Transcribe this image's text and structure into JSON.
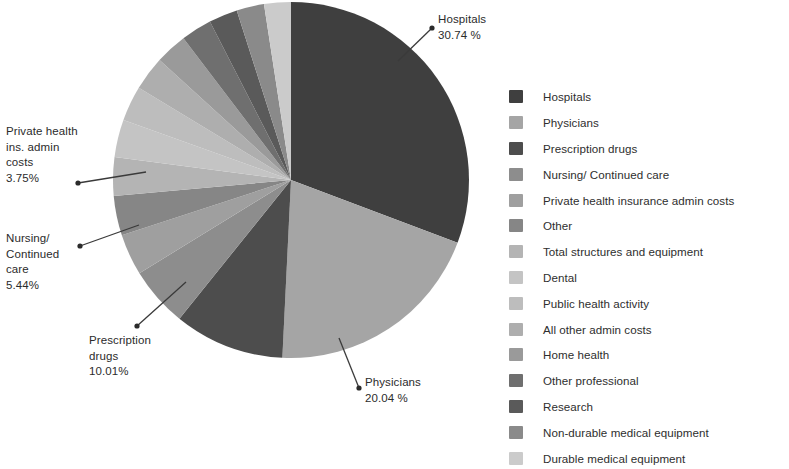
{
  "chart_data": {
    "type": "pie",
    "title": "",
    "start_angle_deg": 0,
    "direction": "clockwise",
    "center": {
      "x": 291,
      "y": 180
    },
    "radius": 178,
    "legend_position": "right",
    "categories": [
      "Hospitals",
      "Physicians",
      "Prescription drugs",
      "Nursing/ Continued care",
      "Private health insurance admin costs",
      "Other",
      "Total structures and equipment",
      "Dental",
      "Public health activity",
      "All other admin costs",
      "Home health",
      "Other professional",
      "Research",
      "Non-durable medical equipment",
      "Durable medical equipment"
    ],
    "values": [
      30.74,
      20.04,
      10.01,
      5.44,
      3.75,
      3.6,
      3.5,
      3.4,
      3.2,
      3.1,
      2.9,
      2.8,
      2.6,
      2.5,
      2.43
    ],
    "units": "%",
    "colors": [
      "#3f3f3f",
      "#a5a5a5",
      "#4d4d4d",
      "#8d8d8d",
      "#9f9f9f",
      "#868686",
      "#b4b4b4",
      "#c4c4c4",
      "#bdbdbd",
      "#aeaeae",
      "#9a9a9a",
      "#6f6f6f",
      "#5a5a5a",
      "#8a8a8a",
      "#cbcbcb"
    ],
    "labeled_slices": [
      {
        "name": "Hospitals",
        "value": 30.74,
        "label": "Hospitals\n30.74 %"
      },
      {
        "name": "Physicians",
        "value": 20.04,
        "label": "Physicians\n20.04 %"
      },
      {
        "name": "Prescription drugs",
        "value": 10.01,
        "label": "Prescription\ndrugs\n10.01%"
      },
      {
        "name": "Nursing/ Continued care",
        "value": 5.44,
        "label": "Nursing/\nContinued\ncare\n5.44%"
      },
      {
        "name": "Private health ins. admin costs",
        "value": 3.75,
        "label": "Private health\nins. admin\ncosts\n3.75%"
      }
    ]
  },
  "callouts": {
    "hospitals": "Hospitals\n30.74 %",
    "physicians": "Physicians\n20.04 %",
    "prescription_drugs": "Prescription\ndrugs\n10.01%",
    "nursing": "Nursing/\nContinued\ncare\n5.44%",
    "private_admin": "Private health\nins. admin\ncosts\n3.75%"
  },
  "legend": {
    "items": [
      {
        "label": "Hospitals",
        "color": "#3f3f3f"
      },
      {
        "label": "Physicians",
        "color": "#a5a5a5"
      },
      {
        "label": "Prescription drugs",
        "color": "#4d4d4d"
      },
      {
        "label": "Nursing/ Continued care",
        "color": "#8d8d8d"
      },
      {
        "label": "Private health insurance admin costs",
        "color": "#9f9f9f"
      },
      {
        "label": "Other",
        "color": "#868686"
      },
      {
        "label": "Total structures and equipment",
        "color": "#b4b4b4"
      },
      {
        "label": "Dental",
        "color": "#c4c4c4"
      },
      {
        "label": "Public health activity",
        "color": "#bdbdbd"
      },
      {
        "label": "All other admin costs",
        "color": "#aeaeae"
      },
      {
        "label": "Home health",
        "color": "#9a9a9a"
      },
      {
        "label": "Other professional",
        "color": "#6f6f6f"
      },
      {
        "label": "Research",
        "color": "#5a5a5a"
      },
      {
        "label": "Non-durable medical equipment",
        "color": "#8a8a8a"
      },
      {
        "label": "Durable medical equipment",
        "color": "#cbcbcb"
      }
    ]
  }
}
